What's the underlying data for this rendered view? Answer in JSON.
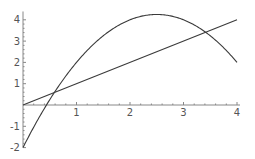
{
  "chart_data": {
    "type": "line",
    "title": "",
    "xlabel": "",
    "ylabel": "",
    "xlim": [
      0,
      4
    ],
    "ylim": [
      -2,
      4.25
    ],
    "grid": false,
    "legend": null,
    "x_ticks": [
      {
        "value": 1,
        "label": "1"
      },
      {
        "value": 2,
        "label": "2"
      },
      {
        "value": 3,
        "label": "3"
      },
      {
        "value": 4,
        "label": "4"
      }
    ],
    "y_ticks": [
      {
        "value": -2,
        "label": "-2"
      },
      {
        "value": -1,
        "label": "-1"
      },
      {
        "value": 1,
        "label": "1"
      },
      {
        "value": 2,
        "label": "2"
      },
      {
        "value": 3,
        "label": "3"
      },
      {
        "value": 4,
        "label": "4"
      }
    ],
    "series": [
      {
        "name": "parabola",
        "description": "y = -2 + 5x - x^2",
        "x": [
          0,
          0.5,
          1,
          1.5,
          2,
          2.5,
          3,
          3.5,
          4
        ],
        "y": [
          -2,
          0.25,
          2,
          3.25,
          4,
          4.25,
          4,
          3.25,
          2
        ]
      },
      {
        "name": "line",
        "description": "y = x",
        "x": [
          0,
          4
        ],
        "y": [
          0,
          4
        ]
      }
    ],
    "annotations": [
      {
        "type": "intersection",
        "x": 0.586,
        "y": 0.586
      },
      {
        "type": "intersection",
        "x": 3.414,
        "y": 3.414
      }
    ]
  },
  "layout": {
    "origin_px": [
      23,
      105
    ],
    "x_unit_px": 53.5,
    "y_unit_px": 21.3
  }
}
